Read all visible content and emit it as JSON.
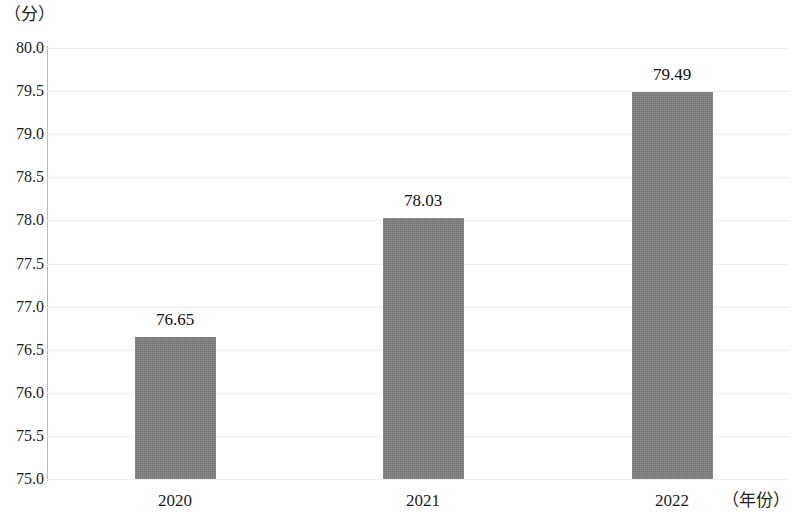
{
  "chart_data": {
    "type": "bar",
    "title": "",
    "subtitle": "",
    "xlabel": "（年份）",
    "ylabel": "（分）",
    "categories": [
      "2020",
      "2021",
      "2022"
    ],
    "values": [
      76.65,
      78.03,
      79.49
    ],
    "value_labels": [
      "76.65",
      "78.03",
      "79.49"
    ],
    "ylim": [
      75.0,
      80.0
    ],
    "ytick_labels": [
      "80.0",
      "79.5",
      "79.0",
      "78.5",
      "78.0",
      "77.5",
      "77.0",
      "76.5",
      "76.0",
      "75.5",
      "75.0"
    ],
    "ytick_values": [
      80.0,
      79.5,
      79.0,
      78.5,
      78.0,
      77.5,
      77.0,
      76.5,
      76.0,
      75.5,
      75.0
    ],
    "grid": true,
    "legend": null,
    "series": [
      {
        "name": "",
        "values": [
          76.65,
          78.03,
          79.49
        ],
        "color": "#808080"
      }
    ],
    "colors": {
      "bar": "#808080",
      "gridline": "#ededed",
      "axis": "#b9b9b9",
      "text": "#1c1c1c",
      "background": "#ffffff"
    }
  }
}
